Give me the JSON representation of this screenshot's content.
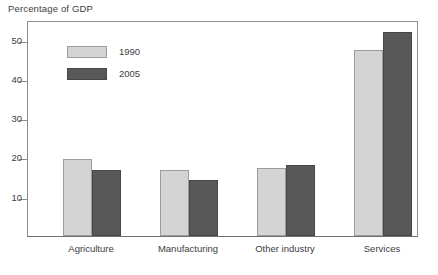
{
  "chart_data": {
    "type": "bar",
    "title": "Percentage of GDP",
    "xlabel": "",
    "ylabel": "",
    "categories": [
      "Agriculture",
      "Manufacturing",
      "Other industry",
      "Services"
    ],
    "series": [
      {
        "name": "1990",
        "color": "#d4d4d4",
        "values": [
          19.6,
          16.8,
          17.4,
          47.3
        ]
      },
      {
        "name": "2005",
        "color": "#585858",
        "values": [
          16.8,
          14.2,
          18.1,
          52.0
        ]
      }
    ],
    "ylim": [
      0,
      55
    ],
    "yticks": [
      10,
      20,
      30,
      40,
      50
    ],
    "ytick_labels": [
      "10",
      "20",
      "30",
      "40",
      "50"
    ],
    "grid": false,
    "legend_position": "top-left-inside"
  },
  "legend": {
    "items": [
      {
        "label": "1990"
      },
      {
        "label": "2005"
      }
    ]
  }
}
